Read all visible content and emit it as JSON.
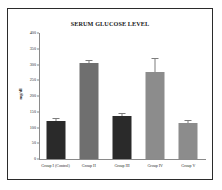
{
  "chart_data": {
    "type": "bar",
    "title": "SERUM GLUCOSE LEVEL",
    "xlabel": "",
    "ylabel": "mg/dl",
    "categories": [
      "Group I (Control)",
      "Group II",
      "Group III",
      "Group IV",
      "Group V"
    ],
    "values": [
      122,
      304,
      138,
      275,
      115
    ],
    "errors": [
      4,
      6,
      5,
      42,
      6
    ],
    "bar_colors": [
      "#2a2a2a",
      "#6f6f6f",
      "#2a2a2a",
      "#8c8c8c",
      "#8c8c8c"
    ],
    "ylim": [
      0,
      400
    ],
    "yticks": [
      0,
      50,
      100,
      150,
      200,
      250,
      300,
      350,
      400
    ],
    "ytick_labels": [
      "0",
      "50",
      "100",
      "150",
      "200",
      "250",
      "300",
      "350",
      "400"
    ],
    "grid": false,
    "legend": false,
    "legend_position": "none"
  },
  "figure": {
    "border_color": "#2b2b2b",
    "background_color": "#ffffff",
    "axis_color": "#8a8a8a",
    "error_bar_color": "#7d7d7d"
  }
}
